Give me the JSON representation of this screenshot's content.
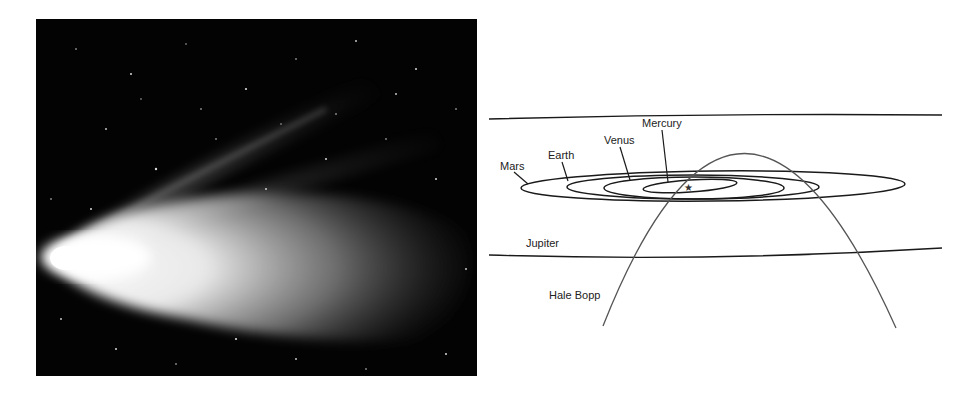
{
  "photo": {
    "subject": "comet-photograph",
    "background_color": "#030303"
  },
  "diagram": {
    "labels": {
      "mercury": "Mercury",
      "venus": "Venus",
      "earth": "Earth",
      "mars": "Mars",
      "jupiter": "Jupiter",
      "comet": "Hale Bopp"
    },
    "sun_symbol": "★",
    "line_color": "#1a1a1a",
    "comet_path_color": "#555555"
  }
}
